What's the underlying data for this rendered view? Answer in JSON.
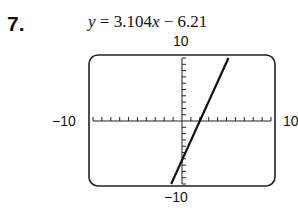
{
  "problem": {
    "number": "7.",
    "equation": {
      "lhs": "y",
      "rhs_coef": "3.104",
      "var": "x",
      "rhs_const": " − 6.21",
      "text": "y = 3.104x − 6.21"
    }
  },
  "window": {
    "ymax_label": "10",
    "ymin_label": "−10",
    "xmin_label": "−10",
    "xmax_label": "10"
  },
  "chart_data": {
    "type": "line",
    "title": "y = 3.104x − 6.21",
    "xlabel": "",
    "ylabel": "",
    "xlim": [
      -10,
      10
    ],
    "ylim": [
      -10,
      10
    ],
    "xtick_scale": 1,
    "ytick_scale": 1,
    "grid": false,
    "series": [
      {
        "name": "y = 3.104x − 6.21",
        "slope": 3.104,
        "intercept": -6.21,
        "x": [
          -1.22,
          5.22
        ],
        "y": [
          -10,
          10
        ]
      }
    ],
    "annotations": [
      "10",
      "−10",
      "−10",
      "10"
    ]
  }
}
